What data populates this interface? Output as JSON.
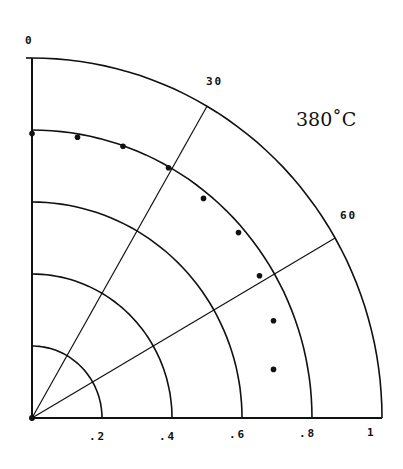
{
  "chart_data": {
    "type": "scatter",
    "subtype": "polar-quadrant",
    "title": "",
    "annotation": "380˚C",
    "angle_labels": [
      {
        "angle_deg": 0,
        "label": "0"
      },
      {
        "angle_deg": 30,
        "label": "30"
      },
      {
        "angle_deg": 60,
        "label": "60"
      }
    ],
    "radial_ticks": [
      ".2",
      ".4",
      ".6",
      ".8",
      "1"
    ],
    "radial_values": [
      0.2,
      0.4,
      0.6,
      0.8,
      1.0
    ],
    "rlim": [
      0,
      1
    ],
    "angle_from": "vertical axis, clockwise",
    "grid": true,
    "points_xy": [
      {
        "x": 0.0,
        "y": 0.79
      },
      {
        "x": 0.13,
        "y": 0.78
      },
      {
        "x": 0.26,
        "y": 0.755
      },
      {
        "x": 0.39,
        "y": 0.695
      },
      {
        "x": 0.49,
        "y": 0.61
      },
      {
        "x": 0.59,
        "y": 0.515
      },
      {
        "x": 0.65,
        "y": 0.395
      },
      {
        "x": 0.69,
        "y": 0.27
      },
      {
        "x": 0.69,
        "y": 0.135
      }
    ]
  },
  "labels": {
    "angle_0": "0",
    "angle_30": "30",
    "angle_60": "60",
    "tick_02": ".2",
    "tick_04": ".4",
    "tick_06": ".6",
    "tick_08": ".8",
    "tick_1": "1",
    "temperature": "380˚C"
  }
}
